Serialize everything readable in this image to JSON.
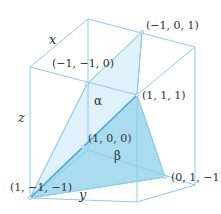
{
  "diagram": {
    "colors": {
      "edge": "#8fcbe6",
      "plane_alpha": "#dff1f9",
      "plane_beta": "#a9dcef",
      "strong_edge": "#4aa8d8",
      "text": "#333333"
    },
    "axes": {
      "x": "x",
      "y": "y",
      "z": "z"
    },
    "planes": [
      {
        "name": "α",
        "vertices": [
          "(1, −1, −1)",
          "(−1, −1, 0)",
          "(−1, 0, 1)",
          "(1, 1, 1)"
        ]
      },
      {
        "name": "β",
        "vertices": [
          "(1, −1, −1)",
          "(1, 1, 1)",
          "(0, 1, −1)"
        ]
      }
    ],
    "points": {
      "p_neg1_neg1_0": "(−1, −1, 0)",
      "p_neg1_0_1": "(−1, 0, 1)",
      "p_1_1_1": "(1, 1, 1)",
      "p_1_0_0": "(1, 0, 0)",
      "p_1_neg1_neg1": "(1, −1, −1)",
      "p_0_1_neg1": "(0, 1, −1)"
    }
  }
}
